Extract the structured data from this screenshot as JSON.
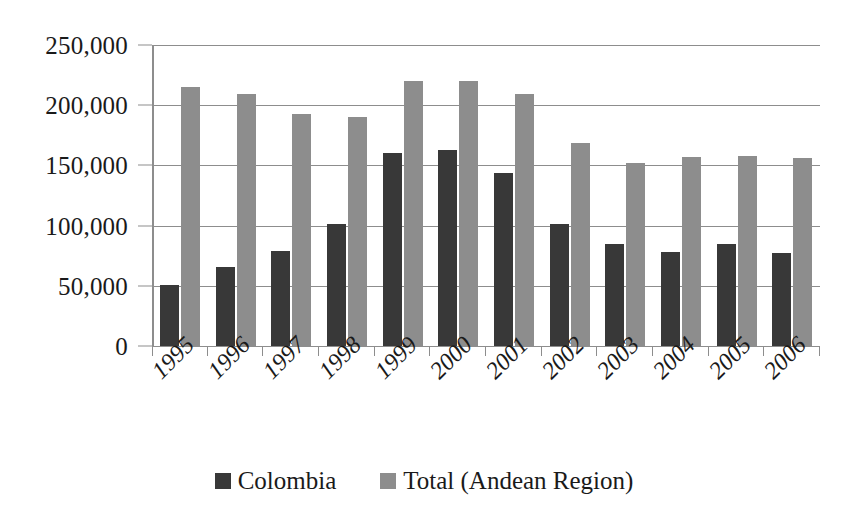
{
  "chart_data": {
    "type": "bar",
    "title": "",
    "subtitle": "",
    "xlabel": "",
    "ylabel": "",
    "categories": [
      "1995",
      "1996",
      "1997",
      "1998",
      "1999",
      "2000",
      "2001",
      "2002",
      "2003",
      "2004",
      "2005",
      "2006"
    ],
    "series": [
      {
        "name": "Colombia",
        "color": "#383838",
        "values": [
          51000,
          66000,
          79000,
          101000,
          160000,
          163000,
          144000,
          101000,
          85000,
          78000,
          85000,
          77000
        ]
      },
      {
        "name": "Total (Andean Region)",
        "color": "#8d8d8d",
        "values": [
          215000,
          209000,
          193000,
          190000,
          220000,
          220000,
          209000,
          169000,
          152000,
          157000,
          158000,
          156000
        ]
      }
    ],
    "ylim": [
      0,
      250000
    ],
    "ytick_values": [
      0,
      50000,
      100000,
      150000,
      200000,
      250000
    ],
    "ytick_labels": [
      "0",
      "50,000",
      "100,000",
      "150,000",
      "200,000",
      "250,000"
    ],
    "grid": true,
    "grid_axis": "y",
    "legend_position": "bottom",
    "legend": [
      "Colombia",
      "Total (Andean Region)"
    ]
  },
  "colors": {
    "series_0": "#383838",
    "series_1": "#8d8d8d",
    "axis": "#8d8d8d",
    "text": "#1a1a1a",
    "background": "#ffffff"
  }
}
